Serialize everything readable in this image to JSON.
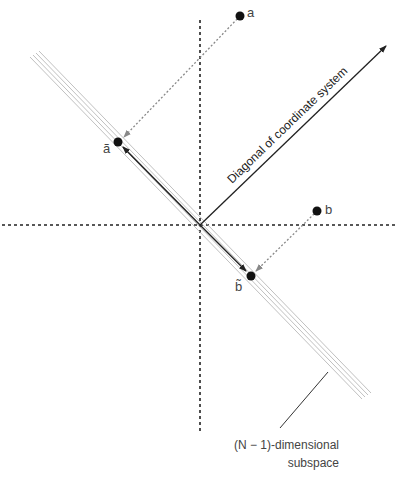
{
  "diagram": {
    "type": "vector-projection",
    "colors": {
      "axis": "#222222",
      "subspace": "#aaaaaa",
      "projection": "#888888",
      "vector": "#222222",
      "point": "#111111"
    },
    "points": {
      "a": {
        "label": "a",
        "x": 240,
        "y": 16
      },
      "a_proj": {
        "label": "ã",
        "x": 118,
        "y": 142
      },
      "b": {
        "label": "b",
        "x": 317,
        "y": 211
      },
      "b_proj": {
        "label": "b̃",
        "x": 251,
        "y": 276
      }
    },
    "origin": {
      "x": 200,
      "y": 225
    },
    "diagonal_label": "Diagonal of coordinate system",
    "subspace_label_line1": "(N − 1)-dimensional",
    "subspace_label_line2": "subspace"
  }
}
